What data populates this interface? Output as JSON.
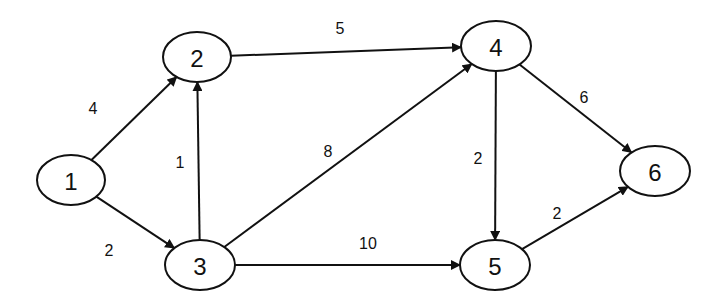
{
  "diagram": {
    "type": "directed-weighted-graph",
    "colors": {
      "stroke": "#111111",
      "background": "#ffffff"
    },
    "nodes": [
      {
        "id": "1",
        "label": "1",
        "cx": 71,
        "cy": 180,
        "rx": 34,
        "ry": 25
      },
      {
        "id": "2",
        "label": "2",
        "cx": 197,
        "cy": 57,
        "rx": 34,
        "ry": 25
      },
      {
        "id": "3",
        "label": "3",
        "cx": 200,
        "cy": 265,
        "rx": 35,
        "ry": 25
      },
      {
        "id": "4",
        "label": "4",
        "cx": 496,
        "cy": 46,
        "rx": 35,
        "ry": 25
      },
      {
        "id": "5",
        "label": "5",
        "cx": 495,
        "cy": 265,
        "rx": 35,
        "ry": 25
      },
      {
        "id": "6",
        "label": "6",
        "cx": 655,
        "cy": 171,
        "rx": 35,
        "ry": 25
      }
    ],
    "edges": [
      {
        "from": "1",
        "to": "2",
        "weight": "4",
        "label_x": 93,
        "label_y": 108
      },
      {
        "from": "1",
        "to": "3",
        "weight": "2",
        "label_x": 109,
        "label_y": 250
      },
      {
        "from": "3",
        "to": "2",
        "weight": "1",
        "label_x": 180,
        "label_y": 162
      },
      {
        "from": "2",
        "to": "4",
        "weight": "5",
        "label_x": 340,
        "label_y": 28
      },
      {
        "from": "3",
        "to": "4",
        "weight": "8",
        "label_x": 328,
        "label_y": 151
      },
      {
        "from": "3",
        "to": "5",
        "weight": "10",
        "label_x": 368,
        "label_y": 243
      },
      {
        "from": "4",
        "to": "5",
        "weight": "2",
        "label_x": 478,
        "label_y": 158
      },
      {
        "from": "4",
        "to": "6",
        "weight": "6",
        "label_x": 584,
        "label_y": 97
      },
      {
        "from": "5",
        "to": "6",
        "weight": "2",
        "label_x": 557,
        "label_y": 213
      }
    ]
  }
}
